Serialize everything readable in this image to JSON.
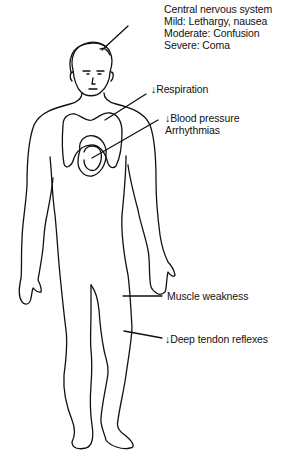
{
  "diagram": {
    "line_color": "#111111",
    "background": "#ffffff",
    "labels": {
      "cns": {
        "title": "Central nervous system",
        "mild": "Mild:  Lethargy, nausea",
        "moderate": "Moderate:  Confusion",
        "severe": "Severe:  Coma"
      },
      "respiration": "↓Respiration",
      "cardiovascular": {
        "line1": "↓Blood pressure",
        "line2": "Arrhythmias"
      },
      "muscle": "Muscle weakness",
      "reflexes": "↓Deep tendon reflexes"
    }
  }
}
